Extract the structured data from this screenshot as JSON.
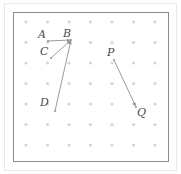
{
  "figure": {
    "title": "",
    "background_color": "#ffffff",
    "outer_frame_color": "#e9e9e9",
    "plot_frame_color": "#8c8c8c",
    "grid_dot_color": "#d6d6d6",
    "line_color": "#8f8f8f",
    "label_color": "#4a4a4a"
  },
  "grid": {
    "columns": 7,
    "rows": 7,
    "origin_x": 26,
    "origin_y": 22,
    "spacing_x": 21.5,
    "spacing_y": 20.5,
    "dot_radius": 1.6
  },
  "points": [
    {
      "name": "A",
      "label": "A",
      "x": 48,
      "y": 41,
      "label_x": 38,
      "label_y": 29
    },
    {
      "name": "B",
      "label": "B",
      "x": 71,
      "y": 40,
      "label_x": 63,
      "label_y": 28
    },
    {
      "name": "C",
      "label": "C",
      "x": 51,
      "y": 58,
      "label_x": 40,
      "label_y": 46
    },
    {
      "name": "D",
      "label": "D",
      "x": 55,
      "y": 111,
      "label_x": 40,
      "label_y": 97
    },
    {
      "name": "P",
      "label": "P",
      "x": 114,
      "y": 60,
      "label_x": 107,
      "label_y": 47
    },
    {
      "name": "Q",
      "label": "Q",
      "x": 136,
      "y": 107,
      "label_x": 137,
      "label_y": 107
    }
  ],
  "vectors": [
    {
      "name": "vector-AB",
      "from": "A",
      "to": "B",
      "label": "AB"
    },
    {
      "name": "vector-CB",
      "from": "C",
      "to": "B",
      "label": "CB"
    },
    {
      "name": "vector-DB",
      "from": "D",
      "to": "B",
      "label": "DB"
    },
    {
      "name": "vector-PQ",
      "from": "P",
      "to": "Q",
      "label": "PQ"
    }
  ]
}
